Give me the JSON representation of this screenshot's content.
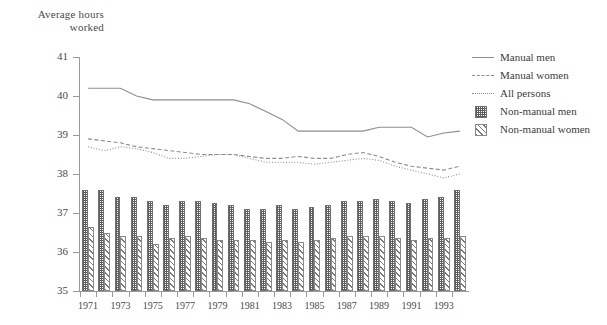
{
  "axis_title": {
    "line1": "Average hours",
    "line2": "worked"
  },
  "legend": {
    "items": [
      {
        "label": "Manual men",
        "key": "line-solid",
        "icon": "solid-line-icon"
      },
      {
        "label": "Manual women",
        "key": "line-dashed",
        "icon": "dashed-line-icon"
      },
      {
        "label": "All persons",
        "key": "line-dotted",
        "icon": "dotted-line-icon"
      },
      {
        "label": "Non-manual men",
        "key": "swatch-men",
        "icon": "checkered-swatch-icon"
      },
      {
        "label": "Non-manual women",
        "key": "swatch-women",
        "icon": "hatched-swatch-icon"
      }
    ]
  },
  "chart_data": {
    "type": "bar",
    "title": "",
    "subtitle": "",
    "xlabel": "",
    "ylabel": "Average hours worked",
    "ylim": [
      35,
      41
    ],
    "ytick_labels": [
      "35",
      "36",
      "37",
      "38",
      "39",
      "40",
      "41"
    ],
    "yticks": [
      35,
      36,
      37,
      38,
      39,
      40,
      41
    ],
    "grid": false,
    "legend_position": "right",
    "x": [
      1971,
      1972,
      1973,
      1974,
      1975,
      1976,
      1977,
      1978,
      1979,
      1980,
      1981,
      1982,
      1983,
      1984,
      1985,
      1986,
      1987,
      1988,
      1989,
      1990,
      1991,
      1992,
      1993,
      1994
    ],
    "xtick_labels": [
      "1971",
      "1973",
      "1975",
      "1977",
      "1979",
      "1981",
      "1983",
      "1985",
      "1987",
      "1989",
      "1991",
      "1993"
    ],
    "xtick_values": [
      1971,
      1973,
      1975,
      1977,
      1979,
      1981,
      1983,
      1985,
      1987,
      1989,
      1991,
      1993
    ],
    "series": [
      {
        "name": "Manual men",
        "style": "solid-line",
        "kind": "line",
        "values": [
          40.2,
          40.2,
          40.2,
          40.0,
          39.9,
          39.9,
          39.9,
          39.9,
          39.9,
          39.9,
          39.8,
          39.6,
          39.4,
          39.1,
          39.1,
          39.1,
          39.1,
          39.1,
          39.2,
          39.2,
          39.2,
          38.95,
          39.05,
          39.1
        ]
      },
      {
        "name": "Manual women",
        "style": "dashed-line",
        "kind": "line",
        "values": [
          38.9,
          38.85,
          38.8,
          38.7,
          38.65,
          38.6,
          38.55,
          38.5,
          38.5,
          38.5,
          38.45,
          38.4,
          38.4,
          38.45,
          38.4,
          38.4,
          38.5,
          38.55,
          38.45,
          38.3,
          38.2,
          38.15,
          38.1,
          38.2
        ]
      },
      {
        "name": "All persons",
        "style": "dotted-line",
        "kind": "line",
        "values": [
          38.7,
          38.6,
          38.7,
          38.65,
          38.55,
          38.4,
          38.4,
          38.45,
          38.5,
          38.5,
          38.4,
          38.3,
          38.3,
          38.3,
          38.25,
          38.3,
          38.35,
          38.4,
          38.35,
          38.2,
          38.1,
          38.0,
          37.9,
          38.0
        ]
      },
      {
        "name": "Non-manual men",
        "style": "checkered-bar",
        "kind": "bar",
        "values": [
          37.6,
          37.6,
          37.4,
          37.4,
          37.3,
          37.2,
          37.3,
          37.3,
          37.25,
          37.2,
          37.1,
          37.1,
          37.2,
          37.1,
          37.15,
          37.2,
          37.3,
          37.3,
          37.35,
          37.3,
          37.25,
          37.35,
          37.4,
          37.6
        ]
      },
      {
        "name": "Non-manual women",
        "style": "hatched-bar",
        "kind": "bar",
        "values": [
          36.65,
          36.5,
          36.4,
          36.4,
          36.2,
          36.35,
          36.4,
          36.35,
          36.3,
          36.3,
          36.3,
          36.25,
          36.3,
          36.25,
          36.3,
          36.35,
          36.4,
          36.4,
          36.4,
          36.35,
          36.3,
          36.35,
          36.35,
          36.4
        ]
      }
    ]
  }
}
